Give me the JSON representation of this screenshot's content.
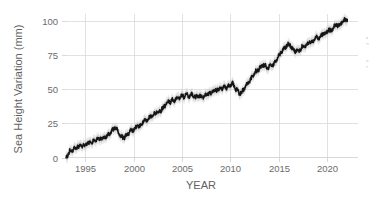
{
  "chart_data": {
    "type": "line",
    "title": "",
    "subtitle": "",
    "xlabel": "YEAR",
    "ylabel": "Sea Height Variation (mm)",
    "xlim": [
      1993.0,
      2022.2
    ],
    "ylim": [
      -3,
      104
    ],
    "xticks": [
      1995,
      2000,
      2005,
      2010,
      2015,
      2020
    ],
    "xtick_labels": [
      "1995",
      "2000",
      "2005",
      "2010",
      "2015",
      "2020"
    ],
    "yticks": [
      0,
      25,
      50,
      75,
      100
    ],
    "ytick_labels": [
      "0",
      "25",
      "50",
      "75",
      "100"
    ],
    "grid": "both",
    "legend": "none",
    "line_color": "#151515",
    "band_color": "#c9c9c9",
    "grid_color": "#d9d9d9",
    "background_color": "#ffffff",
    "uncertainty_mm": 4.0,
    "series": [
      {
        "name": "Sea Height Variation",
        "units": "mm",
        "x": [
          1993.0,
          1993.2,
          1993.4,
          1993.6,
          1993.8,
          1994.0,
          1994.2,
          1994.4,
          1994.6,
          1994.8,
          1995.0,
          1995.2,
          1995.4,
          1995.6,
          1995.8,
          1996.0,
          1996.2,
          1996.4,
          1996.6,
          1996.8,
          1997.0,
          1997.2,
          1997.4,
          1997.6,
          1997.8,
          1998.0,
          1998.2,
          1998.4,
          1998.6,
          1998.8,
          1999.0,
          1999.2,
          1999.4,
          1999.6,
          1999.8,
          2000.0,
          2000.2,
          2000.4,
          2000.6,
          2000.8,
          2001.0,
          2001.2,
          2001.4,
          2001.6,
          2001.8,
          2002.0,
          2002.2,
          2002.4,
          2002.6,
          2002.8,
          2003.0,
          2003.2,
          2003.4,
          2003.6,
          2003.8,
          2004.0,
          2004.2,
          2004.4,
          2004.6,
          2004.8,
          2005.0,
          2005.2,
          2005.4,
          2005.6,
          2005.8,
          2006.0,
          2006.2,
          2006.4,
          2006.6,
          2006.8,
          2007.0,
          2007.2,
          2007.4,
          2007.6,
          2007.8,
          2008.0,
          2008.2,
          2008.4,
          2008.6,
          2008.8,
          2009.0,
          2009.2,
          2009.4,
          2009.6,
          2009.8,
          2010.0,
          2010.2,
          2010.4,
          2010.6,
          2010.8,
          2011.0,
          2011.2,
          2011.4,
          2011.6,
          2011.8,
          2012.0,
          2012.2,
          2012.4,
          2012.6,
          2012.8,
          2013.0,
          2013.2,
          2013.4,
          2013.6,
          2013.8,
          2014.0,
          2014.2,
          2014.4,
          2014.6,
          2014.8,
          2015.0,
          2015.2,
          2015.4,
          2015.6,
          2015.8,
          2016.0,
          2016.2,
          2016.4,
          2016.6,
          2016.8,
          2017.0,
          2017.2,
          2017.4,
          2017.6,
          2017.8,
          2018.0,
          2018.2,
          2018.4,
          2018.6,
          2018.8,
          2019.0,
          2019.2,
          2019.4,
          2019.6,
          2019.8,
          2020.0,
          2020.2,
          2020.4,
          2020.6,
          2020.8,
          2021.0,
          2021.2,
          2021.4,
          2021.6,
          2021.8,
          2022.0,
          2022.1
        ],
        "y": [
          0.0,
          2.0,
          5.5,
          4.5,
          7.0,
          6.0,
          8.5,
          7.5,
          9.5,
          8.5,
          9.0,
          11.0,
          10.0,
          12.0,
          11.5,
          12.5,
          14.0,
          13.0,
          14.5,
          14.0,
          15.5,
          15.0,
          16.5,
          18.0,
          20.0,
          22.0,
          21.5,
          19.0,
          16.0,
          15.0,
          14.5,
          16.0,
          17.5,
          19.0,
          20.5,
          20.0,
          22.0,
          23.5,
          22.5,
          24.5,
          26.0,
          27.5,
          27.0,
          29.0,
          30.5,
          30.0,
          32.0,
          33.5,
          33.0,
          34.5,
          36.0,
          37.5,
          39.5,
          41.0,
          40.5,
          42.5,
          41.5,
          43.5,
          44.0,
          43.5,
          45.5,
          44.5,
          46.0,
          45.5,
          44.5,
          46.5,
          45.0,
          44.0,
          45.5,
          44.5,
          45.0,
          44.0,
          45.5,
          47.0,
          46.5,
          47.5,
          49.0,
          48.5,
          50.0,
          49.5,
          51.0,
          50.5,
          52.0,
          51.0,
          52.5,
          53.0,
          54.5,
          52.5,
          50.0,
          48.5,
          46.5,
          48.0,
          50.0,
          52.5,
          54.5,
          56.0,
          58.5,
          60.0,
          62.5,
          63.5,
          65.0,
          66.5,
          68.0,
          67.0,
          65.5,
          66.5,
          68.0,
          67.5,
          69.5,
          72.0,
          74.5,
          76.5,
          78.5,
          80.5,
          81.5,
          83.0,
          82.0,
          80.0,
          78.5,
          78.0,
          79.0,
          78.5,
          80.5,
          82.0,
          81.5,
          83.0,
          84.5,
          83.5,
          85.5,
          87.0,
          88.5,
          87.5,
          89.5,
          91.0,
          90.5,
          92.0,
          93.5,
          92.5,
          94.5,
          96.0,
          97.5,
          96.5,
          98.0,
          99.5,
          100.5,
          101.0,
          101.2
        ]
      }
    ]
  },
  "axes": {
    "y_title": "Sea Height Variation (mm)",
    "x_title": "YEAR"
  }
}
